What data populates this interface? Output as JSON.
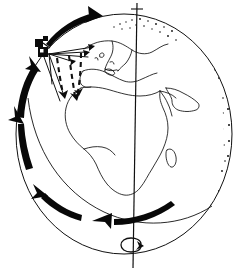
{
  "figure": {
    "title": "Satellite in polar orbit around Earth",
    "style": "line-art",
    "background_color": "#ffffff",
    "ink_color": "#111111"
  },
  "globe": {
    "name": "earth-globe",
    "center_x": 124,
    "center_y": 134,
    "radius_x": 108,
    "radius_y": 120,
    "terminator": {
      "name": "night-side-stipple",
      "side": "right",
      "style": "stippled-shading",
      "dot_color": "#101010",
      "dot_count": 900
    },
    "landmasses": [
      "Africa",
      "Europe",
      "Scandinavia",
      "Mediterranean Sea",
      "Arabian Peninsula",
      "Madagascar",
      "Iberia",
      "British Isles",
      "Black Sea"
    ],
    "equator_visible": true
  },
  "axis": {
    "name": "rotation-axis",
    "label": "",
    "top_x": 137,
    "top_y": 2,
    "bottom_x": 133,
    "bottom_y": 268,
    "spin_arrow": {
      "name": "earth-spin-arrow",
      "direction": "counter-clockwise-from-north",
      "cx": 133,
      "cy": 246,
      "rx": 11,
      "ry": 6
    }
  },
  "satellite": {
    "name": "satellite",
    "x": 44,
    "y": 47,
    "body_width": 11,
    "body_height": 12,
    "panel_present": true,
    "beams": {
      "solid_count": 6,
      "dashed_count": 4,
      "description": "Solid lines show the satellite field of view; dashed arrows show the scan sweep direction across the surface."
    }
  },
  "orbit": {
    "name": "orbit-path",
    "direction": "counter-clockwise",
    "arrow_count": 5,
    "arrows": [
      {
        "name": "orbit-arrow-top",
        "position": "top-left-over-pole",
        "points": "right"
      },
      {
        "name": "orbit-arrow-upper-left",
        "position": "upper-left",
        "points": "up-right"
      },
      {
        "name": "orbit-arrow-mid-left",
        "position": "mid-left",
        "points": "up"
      },
      {
        "name": "orbit-arrow-lower-left",
        "position": "lower-left",
        "points": "up-left"
      },
      {
        "name": "orbit-arrow-bottom",
        "position": "bottom",
        "points": "left"
      }
    ]
  }
}
